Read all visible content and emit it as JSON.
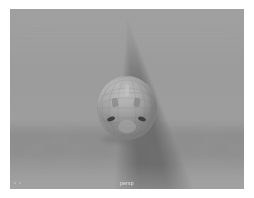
{
  "app": {
    "type": "3d-viewport",
    "panel_name": "perspective-viewport"
  },
  "viewport": {
    "camera_label": "persp",
    "hud_axis": "x   z",
    "background_color": "#9e9e9e",
    "grid_color": "#686868",
    "grid_minor_color": "#828282"
  },
  "scene": {
    "objects": [
      {
        "name": "polySphere",
        "shape": "sphere",
        "shading": "smooth-faceted",
        "fill_color": "#b0b0b0",
        "marking_color": "#3f3f3f"
      },
      {
        "name": "groundGrid",
        "shape": "grid-plane",
        "divisions": "major-minor"
      }
    ]
  },
  "marks": {
    "eye_left": "eye-left-marking",
    "eye_right": "eye-right-marking",
    "brow_left": "brow-left-marking",
    "brow_right": "brow-right-marking",
    "crest": "crest-marking",
    "muzzle": "muzzle-marking"
  }
}
